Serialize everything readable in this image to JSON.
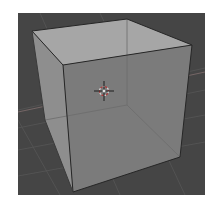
{
  "viewport": {
    "mode": "3D viewport",
    "shading": "X-ray / see-through solid",
    "object": "Cube",
    "colors": {
      "background": "#454545",
      "grid_line": "#5a5a5a",
      "face_top": "#a6a6a6",
      "face_left": "#8e8e8e",
      "face_front": "#7b7b7b",
      "edge_visible": "#262626",
      "edge_hidden": "#6a6a6a",
      "cursor_ring_a": "#d8d8d8",
      "cursor_ring_b": "#b03a3a",
      "cursor_cross": "#1e1e1e"
    },
    "cube_vertices_px": {
      "top_left": [
        32,
        31
      ],
      "top_back": [
        127,
        19
      ],
      "top_right": [
        192,
        45
      ],
      "top_front": [
        63,
        65
      ],
      "bottom_left": [
        45,
        120
      ],
      "bottom_back": [
        127,
        105
      ],
      "bottom_right": [
        180,
        157
      ],
      "bottom_front": [
        73,
        192
      ]
    },
    "cursor_3d_px": [
      104,
      91
    ]
  }
}
